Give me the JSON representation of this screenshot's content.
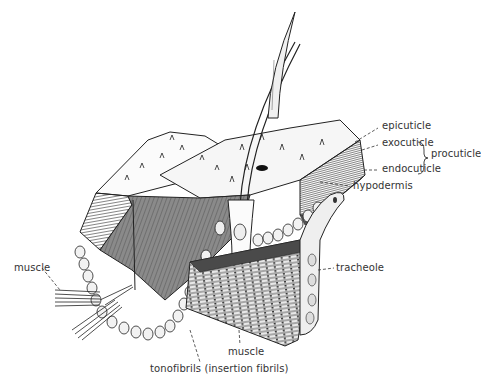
{
  "diagram": {
    "labels": {
      "epicuticle": "epicuticle",
      "exocuticle": "exocuticle",
      "endocuticle": "endocuticle",
      "procuticle": "procuticle",
      "hypodermis": "hypodermis",
      "tracheole": "tracheole",
      "muscle_left": "muscle",
      "muscle_bottom": "muscle",
      "tonofibrils": "tonofibrils (insertion fibrils)"
    },
    "colors": {
      "ink": "#222222",
      "shade": "#6e6e6e",
      "dark": "#3c3c3c",
      "light": "#f4f4f4",
      "label": "#333333"
    }
  }
}
